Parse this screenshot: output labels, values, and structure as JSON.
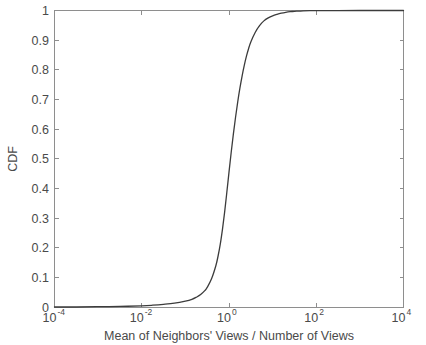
{
  "figure": {
    "background_color": "#ffffff",
    "axis_color": "#8e8e8e",
    "text_color": "#4a4a4a",
    "curve_color": "#3c3c3c"
  },
  "chart_data": {
    "type": "line",
    "title": "",
    "subtitle": "",
    "xlabel": "Mean of Neighbors' Views / Number of Views",
    "ylabel": "CDF",
    "xscale": "log",
    "yscale": "linear",
    "xlim": [
      0.0001,
      10000
    ],
    "ylim": [
      0,
      1
    ],
    "grid": false,
    "legend": null,
    "legend_position": "none",
    "xticks": [
      {
        "value": 0.0001,
        "base": "10",
        "exponent": "-4",
        "label": "10^-4"
      },
      {
        "value": 0.01,
        "base": "10",
        "exponent": "-2",
        "label": "10^-2"
      },
      {
        "value": 1,
        "base": "10",
        "exponent": "0",
        "label": "10^0"
      },
      {
        "value": 100,
        "base": "10",
        "exponent": "2",
        "label": "10^2"
      },
      {
        "value": 10000,
        "base": "10",
        "exponent": "4",
        "label": "10^4"
      }
    ],
    "yticks": [
      {
        "value": 0,
        "label": "0"
      },
      {
        "value": 0.1,
        "label": "0.1"
      },
      {
        "value": 0.2,
        "label": "0.2"
      },
      {
        "value": 0.3,
        "label": "0.3"
      },
      {
        "value": 0.4,
        "label": "0.4"
      },
      {
        "value": 0.5,
        "label": "0.5"
      },
      {
        "value": 0.6,
        "label": "0.6"
      },
      {
        "value": 0.7,
        "label": "0.7"
      },
      {
        "value": 0.8,
        "label": "0.8"
      },
      {
        "value": 0.9,
        "label": "0.9"
      },
      {
        "value": 1,
        "label": "1"
      }
    ],
    "series": [
      {
        "name": "CDF",
        "x": [
          0.0001,
          0.000316,
          0.001,
          0.00316,
          0.01,
          0.0178,
          0.0316,
          0.0562,
          0.1,
          0.141,
          0.178,
          0.224,
          0.282,
          0.316,
          0.398,
          0.501,
          0.562,
          0.631,
          0.708,
          0.794,
          0.891,
          1.0,
          1.122,
          1.259,
          1.413,
          1.585,
          1.778,
          1.995,
          2.239,
          2.512,
          2.818,
          3.162,
          3.981,
          5.012,
          6.31,
          7.943,
          10.0,
          12.59,
          15.85,
          19.95,
          25.12,
          31.62,
          50.12,
          79.43,
          100.0,
          316.2,
          1000.0,
          3162.0,
          10000.0
        ],
        "y": [
          0.0,
          0.0,
          0.001,
          0.002,
          0.004,
          0.006,
          0.009,
          0.013,
          0.02,
          0.026,
          0.033,
          0.042,
          0.056,
          0.066,
          0.095,
          0.14,
          0.172,
          0.212,
          0.262,
          0.32,
          0.386,
          0.455,
          0.521,
          0.583,
          0.64,
          0.692,
          0.738,
          0.779,
          0.815,
          0.846,
          0.872,
          0.894,
          0.926,
          0.949,
          0.965,
          0.975,
          0.982,
          0.987,
          0.991,
          0.994,
          0.996,
          0.997,
          0.999,
          0.9995,
          0.9997,
          0.9999,
          1.0,
          1.0,
          1.0
        ]
      }
    ],
    "annotations": []
  }
}
